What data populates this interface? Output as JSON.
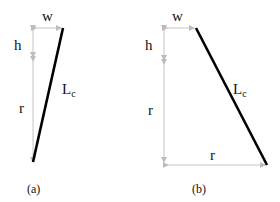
{
  "colors": {
    "dimension_line": "#c4c4c4",
    "main_line": "#000000",
    "text": "#111111"
  },
  "panels": [
    {
      "caption": "(a)",
      "labels": {
        "w": "w",
        "h": "h",
        "r": "r",
        "L": "L",
        "L_sub": "c"
      }
    },
    {
      "caption": "(b)",
      "labels": {
        "w": "w",
        "h": "h",
        "r_vertical": "r",
        "r_horizontal": "r",
        "L": "L",
        "L_sub": "c"
      }
    }
  ]
}
